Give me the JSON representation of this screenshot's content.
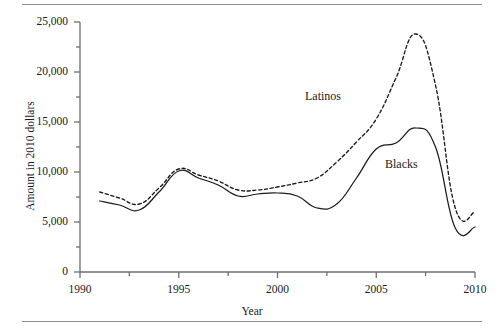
{
  "chart_data": {
    "type": "line",
    "title": "",
    "xlabel": "Year",
    "ylabel": "Amount in 2010 dollars",
    "xlim": [
      1990,
      2010
    ],
    "ylim": [
      0,
      25000
    ],
    "grid": false,
    "legend_position": "inline-annotation",
    "x_ticks": [
      1990,
      1995,
      2000,
      2005,
      2010
    ],
    "x_tick_labels": [
      "1990",
      "1995",
      "2000",
      "2005",
      "2010"
    ],
    "x_minor_ticks": [
      1992.5,
      1997.5,
      2002.5,
      2007.5
    ],
    "y_ticks": [
      0,
      5000,
      10000,
      15000,
      20000,
      25000
    ],
    "y_tick_labels": [
      "0",
      "5,000",
      "10,000",
      "15,000",
      "20,000",
      "25,000"
    ],
    "y_minor_ticks": [
      2500,
      7500,
      12500,
      17500,
      22500
    ],
    "x": [
      1991,
      1992,
      1993,
      1994,
      1995,
      1996,
      1997,
      1998,
      1999,
      2000,
      2001,
      2002,
      2003,
      2004,
      2005,
      2006,
      2007,
      2008,
      2009,
      2010
    ],
    "series": [
      {
        "name": "Latinos",
        "style": "dashed",
        "color": "#1a1a1a",
        "values": [
          8000,
          7400,
          6800,
          8400,
          10300,
          9700,
          9100,
          8200,
          8200,
          8500,
          8900,
          9400,
          11000,
          13000,
          15300,
          19400,
          23800,
          18700,
          6400,
          6000
        ]
      },
      {
        "name": "Blacks",
        "style": "solid",
        "color": "#1a1a1a",
        "values": [
          7100,
          6700,
          6200,
          8000,
          10100,
          9400,
          8700,
          7600,
          7800,
          7900,
          7600,
          6400,
          6800,
          9400,
          12300,
          12900,
          14400,
          12500,
          4400,
          4500
        ]
      }
    ],
    "annotations": [
      {
        "text": "Latinos",
        "x": 2002.4,
        "y": 16000
      },
      {
        "text": "Blacks",
        "x": 2006.4,
        "y": 11100
      }
    ]
  },
  "axis_titles": {
    "y": "Amount in 2010 dollars",
    "x": "Year"
  }
}
